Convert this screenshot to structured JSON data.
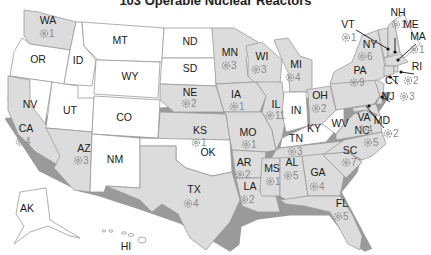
{
  "title": "103 Operable Nuclear Reactors",
  "legend_icon": "reactor-gear-icon",
  "colors": {
    "with_reactors": "#dcdcdc",
    "without_reactors": "#ffffff",
    "border": "#9a9a9a",
    "label": "#1a1a1a",
    "count": "#8a8a8a"
  },
  "states": [
    {
      "abbr": "WA",
      "count": "1"
    },
    {
      "abbr": "OR",
      "count": null
    },
    {
      "abbr": "ID",
      "count": null
    },
    {
      "abbr": "MT",
      "count": null
    },
    {
      "abbr": "WY",
      "count": null
    },
    {
      "abbr": "ND",
      "count": null
    },
    {
      "abbr": "SD",
      "count": null
    },
    {
      "abbr": "NV",
      "count": null
    },
    {
      "abbr": "UT",
      "count": null
    },
    {
      "abbr": "CO",
      "count": null
    },
    {
      "abbr": "CA",
      "count": "4"
    },
    {
      "abbr": "AZ",
      "count": "3"
    },
    {
      "abbr": "NM",
      "count": null
    },
    {
      "abbr": "MN",
      "count": "3"
    },
    {
      "abbr": "WI",
      "count": "3"
    },
    {
      "abbr": "MI",
      "count": "4"
    },
    {
      "abbr": "NE",
      "count": "2"
    },
    {
      "abbr": "IA",
      "count": "1"
    },
    {
      "abbr": "IL",
      "count": "11"
    },
    {
      "abbr": "IN",
      "count": null
    },
    {
      "abbr": "OH",
      "count": "2"
    },
    {
      "abbr": "KS",
      "count": "1"
    },
    {
      "abbr": "MO",
      "count": "1"
    },
    {
      "abbr": "OK",
      "count": null
    },
    {
      "abbr": "KY",
      "count": null
    },
    {
      "abbr": "WV",
      "count": null
    },
    {
      "abbr": "TX",
      "count": "4"
    },
    {
      "abbr": "AR",
      "count": "2"
    },
    {
      "abbr": "LA",
      "count": "2"
    },
    {
      "abbr": "MS",
      "count": "1"
    },
    {
      "abbr": "TN",
      "count": "3"
    },
    {
      "abbr": "AL",
      "count": "5"
    },
    {
      "abbr": "GA",
      "count": "4"
    },
    {
      "abbr": "FL",
      "count": "5"
    },
    {
      "abbr": "SC",
      "count": "7"
    },
    {
      "abbr": "NC",
      "count": "5"
    },
    {
      "abbr": "VA",
      "count": "4"
    },
    {
      "abbr": "PA",
      "count": "9"
    },
    {
      "abbr": "NY",
      "count": "6"
    },
    {
      "abbr": "VT",
      "count": "1"
    },
    {
      "abbr": "NH",
      "count": "1"
    },
    {
      "abbr": "ME",
      "count": null
    },
    {
      "abbr": "MA",
      "count": "1"
    },
    {
      "abbr": "RI",
      "count": null
    },
    {
      "abbr": "CT",
      "count": "2"
    },
    {
      "abbr": "NJ",
      "count": "3"
    },
    {
      "abbr": "MD",
      "count": "2"
    },
    {
      "abbr": "AK",
      "count": null
    },
    {
      "abbr": "HI",
      "count": null
    }
  ]
}
